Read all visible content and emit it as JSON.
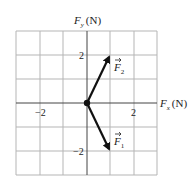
{
  "diagram": {
    "x_axis": {
      "symbol": "F",
      "subscript": "x",
      "unit": "(N)"
    },
    "y_axis": {
      "symbol": "F",
      "subscript": "y",
      "unit": "(N)"
    },
    "x_ticks": [
      {
        "value": -2,
        "label": "−2"
      },
      {
        "value": 2,
        "label": "2"
      }
    ],
    "y_ticks": [
      {
        "value": 2,
        "label": "2"
      },
      {
        "value": -2,
        "label": "−2"
      }
    ],
    "grid": {
      "x_range": [
        -3,
        3
      ],
      "y_range": [
        -3,
        3
      ],
      "step": 1
    },
    "vectors": [
      {
        "name": "F",
        "subscript": "2",
        "components": [
          1,
          2
        ]
      },
      {
        "name": "F",
        "subscript": "1",
        "components": [
          1,
          -2
        ]
      }
    ],
    "colors": {
      "grid": "#b0b0b0",
      "axis": "#333333",
      "vector": "#111111"
    }
  }
}
